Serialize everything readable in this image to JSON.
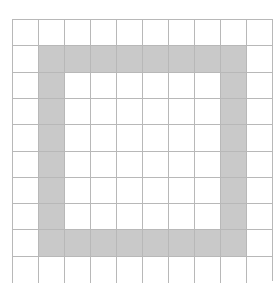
{
  "diagram": {
    "type": "grid-pattern",
    "columns": 10,
    "rows": 10,
    "cell_width": 26,
    "cell_height": 26.3,
    "grid_color": "#b8b8b8",
    "fill_color": "#c9c9c9",
    "background_color": "#ffffff",
    "shape": "hollow square ring",
    "ring": {
      "col_start": 1,
      "col_end": 8,
      "row_start": 1,
      "row_end": 8
    }
  }
}
